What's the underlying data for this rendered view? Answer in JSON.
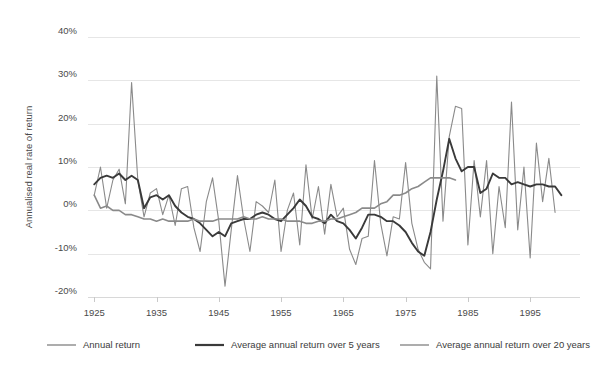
{
  "chart_data": {
    "type": "line",
    "title": "",
    "subtitle": "",
    "xlabel": "",
    "ylabel": "Annualised real rate of return",
    "xlim": [
      1924,
      2003
    ],
    "ylim": [
      -20,
      40
    ],
    "grid": true,
    "legend_position": "bottom",
    "x_ticks": [
      1925,
      1935,
      1945,
      1955,
      1965,
      1975,
      1985,
      1995
    ],
    "x_tick_labels": [
      "1925",
      "1935",
      "1945",
      "1955",
      "1965",
      "1975",
      "1985",
      "1995"
    ],
    "y_ticks": [
      -20,
      -10,
      0,
      10,
      20,
      30,
      40
    ],
    "y_tick_labels": [
      "-20%",
      "-10%",
      "0%",
      "10%",
      "20%",
      "30%",
      "40%"
    ],
    "series": [
      {
        "name": "Annual return",
        "color": "#8a8a8a",
        "width": 1.1,
        "x": [
          1925,
          1926,
          1927,
          1928,
          1929,
          1930,
          1931,
          1932,
          1933,
          1934,
          1935,
          1936,
          1937,
          1938,
          1939,
          1940,
          1941,
          1942,
          1943,
          1944,
          1945,
          1946,
          1947,
          1948,
          1949,
          1950,
          1951,
          1952,
          1953,
          1954,
          1955,
          1956,
          1957,
          1958,
          1959,
          1960,
          1961,
          1962,
          1963,
          1964,
          1965,
          1966,
          1967,
          1968,
          1969,
          1970,
          1971,
          1972,
          1973,
          1974,
          1975,
          1976,
          1977,
          1978,
          1979,
          1980,
          1981,
          1982,
          1983,
          1984,
          1985,
          1986,
          1987,
          1988,
          1989,
          1990,
          1991,
          1992,
          1993,
          1994,
          1995,
          1996,
          1997,
          1998,
          1999,
          2000,
          2001,
          2002
        ],
        "values": [
          3.5,
          10.0,
          0.5,
          7.0,
          9.5,
          1.5,
          29.5,
          7.0,
          -1.5,
          4.0,
          5.0,
          -1.0,
          3.5,
          -3.5,
          5.0,
          5.5,
          -4.0,
          -9.5,
          2.0,
          7.5,
          -2.5,
          -17.5,
          -4.5,
          8.0,
          -2.0,
          -9.5,
          2.0,
          1.0,
          -0.5,
          7.0,
          -9.5,
          0.0,
          4.0,
          -8.0,
          10.5,
          -2.0,
          5.5,
          -5.5,
          6.0,
          -1.5,
          0.5,
          -9.0,
          -12.5,
          -6.5,
          -6.0,
          11.5,
          -3.0,
          -10.5,
          -1.5,
          -2.0,
          11.0,
          -3.0,
          -9.0,
          -12.0,
          -13.5,
          31.0,
          -2.5,
          17.0,
          24.0,
          23.5,
          -8.0,
          11.5,
          -1.5,
          11.5,
          -10.0,
          5.5,
          -4.0,
          25.0,
          -4.5,
          10.0,
          -11.0,
          15.5,
          2.0,
          12.0,
          -0.5,
          null,
          null,
          null
        ]
      },
      {
        "name": "Average annual return over 5 years",
        "color": "#3a3a3a",
        "width": 1.9,
        "x": [
          1925,
          1926,
          1927,
          1928,
          1929,
          1930,
          1931,
          1932,
          1933,
          1934,
          1935,
          1936,
          1937,
          1938,
          1939,
          1940,
          1941,
          1942,
          1943,
          1944,
          1945,
          1946,
          1947,
          1948,
          1949,
          1950,
          1951,
          1952,
          1953,
          1954,
          1955,
          1956,
          1957,
          1958,
          1959,
          1960,
          1961,
          1962,
          1963,
          1964,
          1965,
          1966,
          1967,
          1968,
          1969,
          1970,
          1971,
          1972,
          1973,
          1974,
          1975,
          1976,
          1977,
          1978,
          1979,
          1980,
          1981,
          1982,
          1983,
          1984,
          1985,
          1986,
          1987,
          1988,
          1989,
          1990,
          1991,
          1992,
          1993,
          1994,
          1995,
          1996,
          1997,
          1998,
          1999,
          2000
        ],
        "values": [
          6.0,
          7.5,
          8.0,
          7.5,
          8.5,
          7.0,
          8.0,
          7.0,
          0.5,
          3.0,
          3.5,
          2.5,
          3.5,
          1.0,
          -0.5,
          -1.5,
          -2.0,
          -3.0,
          -4.5,
          -6.0,
          -5.0,
          -6.0,
          -3.0,
          -2.5,
          -2.0,
          -2.0,
          -1.0,
          -0.5,
          -1.0,
          -2.0,
          -2.5,
          -1.0,
          0.5,
          2.5,
          1.0,
          -1.5,
          -2.0,
          -3.0,
          -1.0,
          -2.5,
          -3.0,
          -4.5,
          -6.5,
          -4.0,
          -1.0,
          -1.0,
          -1.5,
          -2.5,
          -2.5,
          -3.5,
          -5.0,
          -7.5,
          -9.5,
          -10.5,
          -5.0,
          2.5,
          9.0,
          16.5,
          12.0,
          9.0,
          10.0,
          10.0,
          4.0,
          5.0,
          8.5,
          7.5,
          7.5,
          6.0,
          6.5,
          6.0,
          5.5,
          6.0,
          6.0,
          5.5,
          5.5,
          3.5
        ]
      },
      {
        "name": "Average annual return over 20 years",
        "color": "#8a8a8a",
        "width": 1.6,
        "x": [
          1925,
          1926,
          1927,
          1928,
          1929,
          1930,
          1931,
          1932,
          1933,
          1934,
          1935,
          1936,
          1937,
          1938,
          1939,
          1940,
          1941,
          1942,
          1943,
          1944,
          1945,
          1946,
          1947,
          1948,
          1949,
          1950,
          1951,
          1952,
          1953,
          1954,
          1955,
          1956,
          1957,
          1958,
          1959,
          1960,
          1961,
          1962,
          1963,
          1964,
          1965,
          1966,
          1967,
          1968,
          1969,
          1970,
          1971,
          1972,
          1973,
          1974,
          1975,
          1976,
          1977,
          1978,
          1979,
          1980,
          1981,
          1982,
          1983
        ],
        "values": [
          3.5,
          0.5,
          1.0,
          0.0,
          0.0,
          -1.0,
          -1.0,
          -1.5,
          -2.0,
          -2.0,
          -2.5,
          -2.0,
          -2.5,
          -2.5,
          -2.5,
          -2.5,
          -2.0,
          -2.5,
          -2.5,
          -2.5,
          -2.0,
          -2.0,
          -2.0,
          -2.0,
          -1.5,
          -2.0,
          -2.0,
          -1.5,
          -2.0,
          -2.0,
          -2.0,
          -2.5,
          -2.5,
          -2.5,
          -3.0,
          -3.0,
          -2.5,
          -2.5,
          -2.0,
          -2.0,
          -1.5,
          -1.0,
          -0.5,
          0.5,
          0.5,
          0.5,
          1.5,
          2.0,
          3.5,
          3.5,
          4.0,
          5.0,
          5.5,
          6.5,
          7.5,
          7.5,
          7.5,
          7.5,
          7.0
        ]
      }
    ]
  },
  "legend": {
    "items": [
      {
        "label": "Annual return",
        "color": "#8a8a8a"
      },
      {
        "label": "Average annual return over 5 years",
        "color": "#3a3a3a"
      },
      {
        "label": "Average annual return over 20 years",
        "color": "#8a8a8a"
      }
    ]
  },
  "axes": {
    "y_title": "Annualised real rate of return"
  }
}
